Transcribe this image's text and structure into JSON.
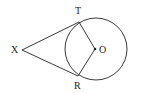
{
  "diagram": {
    "points": {
      "X": {
        "label": "X"
      },
      "T": {
        "label": "T"
      },
      "R": {
        "label": "R"
      },
      "O": {
        "label": "O"
      }
    },
    "segments": [
      "XT",
      "XR",
      "TO",
      "RO"
    ],
    "circle": {
      "center": "O"
    },
    "colors": {
      "stroke": "#3a3a3a",
      "text": "#222222",
      "background": "#ffffff"
    }
  }
}
